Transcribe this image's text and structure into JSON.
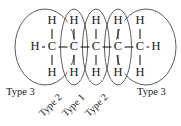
{
  "figure": {
    "colors": {
      "ink": "#1a1a1a",
      "ellipse_stroke": "#4a4a4a",
      "background": "#ffffff"
    },
    "backbone": {
      "terminal_h_left": "H",
      "terminal_h_right": "H",
      "carbons": [
        "C",
        "C",
        "C",
        "C",
        "C"
      ]
    },
    "upper_hydrogens": [
      "H",
      "H",
      "H",
      "H",
      "H"
    ],
    "lower_hydrogens": [
      "H",
      "H",
      "H",
      "H",
      "H"
    ],
    "group_labels": [
      {
        "text": "Type 3",
        "rotated": false
      },
      {
        "text": "Type 2",
        "rotated": true
      },
      {
        "text": "Type 1",
        "rotated": true
      },
      {
        "text": "Type 2",
        "rotated": true
      },
      {
        "text": "Type 3",
        "rotated": false
      }
    ]
  }
}
